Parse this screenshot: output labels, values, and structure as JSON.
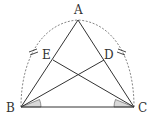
{
  "diagram": {
    "type": "geometry",
    "points": {
      "A": {
        "label": "A",
        "x": 78,
        "y": 20
      },
      "B": {
        "label": "B",
        "x": 21,
        "y": 107
      },
      "C": {
        "label": "C",
        "x": 134,
        "y": 107
      },
      "D": {
        "label": "D",
        "x": 104,
        "y": 60
      },
      "E": {
        "label": "E",
        "x": 53,
        "y": 60
      }
    },
    "segments": [
      {
        "from": "A",
        "to": "B"
      },
      {
        "from": "A",
        "to": "C"
      },
      {
        "from": "B",
        "to": "C"
      },
      {
        "from": "B",
        "to": "D"
      },
      {
        "from": "C",
        "to": "E"
      }
    ],
    "arc": {
      "style": "dashed",
      "through": [
        "B",
        "A",
        "C"
      ],
      "tick_marks": "double"
    },
    "marked_angles": [
      {
        "vertex": "B",
        "between": [
          "C",
          "D"
        ],
        "shaded": true
      },
      {
        "vertex": "C",
        "between": [
          "B",
          "E"
        ],
        "shaded": true
      }
    ],
    "colors": {
      "line": "#333333",
      "dashed": "#666666",
      "shade": "#d9d9d9"
    }
  }
}
